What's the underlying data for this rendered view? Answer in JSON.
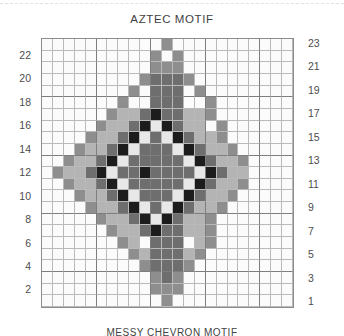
{
  "page": {
    "title": "AZTEC MOTIF",
    "bottom_title": "MESSY CHEVRON MOTIF"
  },
  "axes": {
    "left_labels": [
      "22",
      "20",
      "18",
      "16",
      "14",
      "12",
      "10",
      "8",
      "6",
      "4",
      "2"
    ],
    "right_labels": [
      "23",
      "21",
      "19",
      "17",
      "15",
      "13",
      "11",
      "9",
      "7",
      "5",
      "3",
      "1"
    ]
  },
  "palette": {
    "0": "#fbfbfb",
    "1": "#e8e8e8",
    "2": "#b4b4b4",
    "3": "#8e8e8e",
    "4": "#6e6e6e",
    "5": "#1c1c1c"
  },
  "chart_data": {
    "type": "heatmap",
    "title": "AZTEC MOTIF",
    "xlabel": "",
    "ylabel": "",
    "rows": 23,
    "cols": 23,
    "legend_position": "none",
    "grid": true,
    "x": [
      1,
      2,
      3,
      4,
      5,
      6,
      7,
      8,
      9,
      10,
      11,
      12,
      13,
      14,
      15,
      16,
      17,
      18,
      19,
      20,
      21,
      22,
      23
    ],
    "y": [
      23,
      22,
      21,
      20,
      19,
      18,
      17,
      16,
      15,
      14,
      13,
      12,
      11,
      10,
      9,
      8,
      7,
      6,
      5,
      4,
      3,
      2,
      1
    ],
    "value_levels": [
      0,
      1,
      2,
      3,
      4,
      5
    ],
    "values": [
      [
        0,
        0,
        0,
        0,
        0,
        0,
        0,
        0,
        0,
        0,
        0,
        3,
        0,
        0,
        0,
        0,
        0,
        0,
        0,
        0,
        0,
        0,
        0
      ],
      [
        0,
        0,
        0,
        0,
        0,
        0,
        0,
        0,
        0,
        0,
        3,
        0,
        3,
        0,
        0,
        0,
        0,
        0,
        0,
        0,
        0,
        0,
        0
      ],
      [
        0,
        0,
        0,
        0,
        0,
        0,
        0,
        0,
        0,
        0,
        3,
        3,
        3,
        0,
        0,
        0,
        0,
        0,
        0,
        0,
        0,
        0,
        0
      ],
      [
        0,
        0,
        0,
        0,
        0,
        0,
        0,
        0,
        0,
        3,
        4,
        4,
        4,
        3,
        0,
        0,
        0,
        0,
        0,
        0,
        0,
        0,
        0
      ],
      [
        0,
        0,
        0,
        0,
        0,
        0,
        0,
        0,
        3,
        0,
        4,
        4,
        4,
        0,
        3,
        0,
        0,
        0,
        0,
        0,
        0,
        0,
        0
      ],
      [
        0,
        0,
        0,
        0,
        0,
        0,
        0,
        3,
        0,
        0,
        4,
        4,
        4,
        0,
        0,
        3,
        0,
        0,
        0,
        0,
        0,
        0,
        0
      ],
      [
        0,
        0,
        0,
        0,
        0,
        0,
        3,
        2,
        2,
        4,
        5,
        4,
        4,
        2,
        2,
        3,
        0,
        0,
        0,
        0,
        0,
        0,
        0
      ],
      [
        0,
        0,
        0,
        0,
        0,
        3,
        2,
        2,
        4,
        5,
        1,
        5,
        4,
        2,
        2,
        0,
        3,
        0,
        0,
        0,
        0,
        0,
        0
      ],
      [
        0,
        0,
        0,
        0,
        3,
        2,
        2,
        4,
        5,
        1,
        4,
        1,
        5,
        4,
        2,
        2,
        3,
        0,
        0,
        0,
        0,
        0,
        0
      ],
      [
        0,
        0,
        0,
        3,
        2,
        2,
        4,
        5,
        1,
        4,
        4,
        4,
        1,
        5,
        4,
        2,
        2,
        3,
        0,
        0,
        0,
        0,
        0
      ],
      [
        0,
        0,
        3,
        2,
        2,
        4,
        5,
        1,
        4,
        4,
        4,
        4,
        4,
        1,
        5,
        4,
        2,
        2,
        3,
        0,
        0,
        0,
        0
      ],
      [
        0,
        3,
        2,
        2,
        4,
        5,
        1,
        4,
        4,
        5,
        4,
        4,
        4,
        4,
        1,
        5,
        4,
        2,
        2,
        0,
        0,
        0,
        0
      ],
      [
        0,
        0,
        3,
        2,
        2,
        4,
        5,
        1,
        4,
        4,
        4,
        4,
        4,
        1,
        5,
        4,
        2,
        2,
        3,
        0,
        0,
        0,
        0
      ],
      [
        0,
        0,
        0,
        3,
        2,
        2,
        4,
        5,
        1,
        4,
        4,
        4,
        1,
        5,
        4,
        2,
        2,
        3,
        0,
        0,
        0,
        0,
        0
      ],
      [
        0,
        0,
        0,
        0,
        3,
        2,
        2,
        4,
        5,
        1,
        4,
        1,
        5,
        4,
        2,
        2,
        3,
        0,
        0,
        0,
        0,
        0,
        0
      ],
      [
        0,
        0,
        0,
        0,
        0,
        3,
        2,
        2,
        4,
        5,
        1,
        5,
        4,
        2,
        2,
        3,
        0,
        0,
        0,
        0,
        0,
        0,
        0
      ],
      [
        0,
        0,
        0,
        0,
        0,
        0,
        3,
        2,
        2,
        4,
        5,
        4,
        4,
        2,
        2,
        3,
        0,
        0,
        0,
        0,
        0,
        0,
        0
      ],
      [
        0,
        0,
        0,
        0,
        0,
        0,
        0,
        3,
        2,
        0,
        4,
        4,
        4,
        0,
        2,
        3,
        0,
        0,
        0,
        0,
        0,
        0,
        0
      ],
      [
        0,
        0,
        0,
        0,
        0,
        0,
        0,
        0,
        3,
        2,
        4,
        4,
        4,
        2,
        3,
        0,
        0,
        0,
        0,
        0,
        0,
        0,
        0
      ],
      [
        0,
        0,
        0,
        0,
        0,
        0,
        0,
        0,
        0,
        3,
        4,
        4,
        4,
        3,
        0,
        0,
        0,
        0,
        0,
        0,
        0,
        0,
        0
      ],
      [
        0,
        0,
        0,
        0,
        0,
        0,
        0,
        0,
        0,
        0,
        3,
        4,
        3,
        0,
        0,
        0,
        0,
        0,
        0,
        0,
        0,
        0,
        0
      ],
      [
        0,
        0,
        0,
        0,
        0,
        0,
        0,
        0,
        0,
        0,
        3,
        3,
        3,
        0,
        0,
        0,
        0,
        0,
        0,
        0,
        0,
        0,
        0
      ],
      [
        0,
        0,
        0,
        0,
        0,
        0,
        0,
        0,
        0,
        0,
        0,
        3,
        0,
        0,
        0,
        0,
        0,
        0,
        0,
        0,
        0,
        0,
        0
      ]
    ]
  }
}
